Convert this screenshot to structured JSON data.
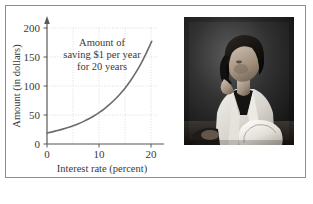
{
  "figure": {
    "border_color": "#8d8d8d",
    "background": "#ffffff"
  },
  "chart_data": {
    "type": "line",
    "title": "",
    "subtitle": "",
    "xlabel": "Interest rate (percent)",
    "ylabel": "Amount (in dollars)",
    "xlim": [
      0,
      21
    ],
    "ylim": [
      0,
      210
    ],
    "xticks": [
      "0",
      "10",
      "20"
    ],
    "xtick_values": [
      0,
      10,
      20
    ],
    "yticks": [
      "0",
      "50",
      "100",
      "150",
      "200"
    ],
    "ytick_values": [
      0,
      50,
      100,
      150,
      200
    ],
    "grid": true,
    "grid_style": "dotted",
    "legend": "none",
    "curve_color": "#6b6b6b",
    "annotation": {
      "lines": [
        "Amount of",
        "saving $1 per year",
        "for 20 years"
      ],
      "text": "Amount of saving $1 per year for 20 years"
    },
    "series": [
      {
        "name": "Amount after 20 years of saving $1 per year",
        "x": [
          0,
          1,
          2,
          3,
          4,
          5,
          6,
          7,
          8,
          9,
          10,
          11,
          12,
          13,
          14,
          15,
          16,
          17,
          18,
          19,
          20
        ],
        "values": [
          20,
          22,
          24.3,
          26.9,
          29.8,
          33.1,
          36.8,
          41.0,
          45.8,
          51.2,
          57.3,
          64.2,
          72.1,
          81.0,
          91.0,
          102.4,
          115.4,
          130.0,
          146.6,
          165.4,
          186.0
        ]
      }
    ]
  },
  "photo": {
    "caption": "",
    "description": "Black and white photograph of a woman in a white coat holding a telephone handset and looking down at paperwork",
    "alt": "woman-on-phone-with-paperwork"
  }
}
